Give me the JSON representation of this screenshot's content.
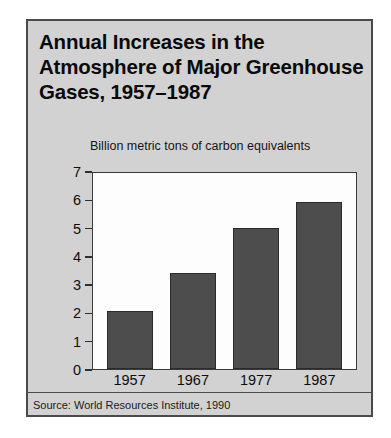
{
  "figure": {
    "title": "Annual Increases in the Atmosphere of Major Greenhouse Gases, 1957–1987",
    "subtitle": "Billion metric tons of carbon equivalents",
    "source": "Source: World Resources Institute, 1990",
    "frame_background": "#d2d2d2",
    "plot_background": "#fdfdfd",
    "bar_color": "#4d4d4d",
    "border_color": "#4a4a4a"
  },
  "chart_data": {
    "type": "bar",
    "title": "Annual Increases in the Atmosphere of Major Greenhouse Gases, 1957–1987",
    "subtitle": "Billion metric tons of carbon equivalents",
    "categories": [
      "1957",
      "1967",
      "1977",
      "1987"
    ],
    "values": [
      2.05,
      3.4,
      5.0,
      5.9
    ],
    "xlabel": "",
    "ylabel": "Billion metric tons of carbon equivalents",
    "ylim": [
      0,
      7
    ],
    "yticks": [
      7,
      6,
      5,
      4,
      3,
      2,
      1,
      0
    ],
    "ytick_labels": [
      "7",
      "6",
      "5",
      "4",
      "3",
      "2",
      "1",
      "0"
    ],
    "grid": false,
    "legend": false,
    "source": "Source: World Resources Institute, 1990"
  }
}
